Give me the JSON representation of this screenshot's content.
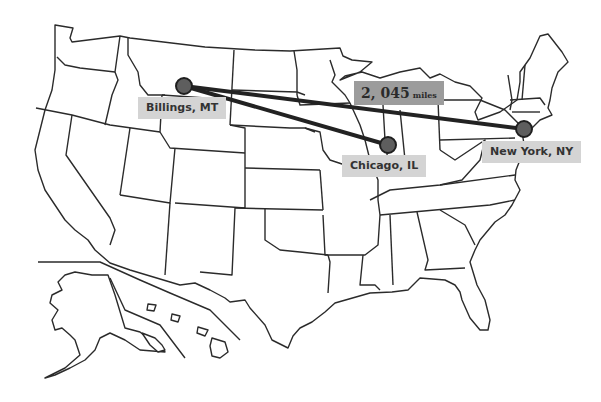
{
  "map": {
    "title": "United States map",
    "style": {
      "background": "#ffffff",
      "stroke": "#2b2b2b",
      "route": "#222222",
      "marker": "#5e5e5e",
      "label_bg": "#d4d4d4",
      "distance_bg": "#9c9c9c"
    }
  },
  "cities": [
    {
      "id": "billings",
      "label": "Billings, MT",
      "x": 184,
      "y": 86
    },
    {
      "id": "chicago",
      "label": "Chicago, IL",
      "x": 388,
      "y": 145
    },
    {
      "id": "newyork",
      "label": "New York, NY",
      "x": 524,
      "y": 129
    }
  ],
  "routes": [
    {
      "from": "Billings, MT",
      "to": "Chicago, IL"
    },
    {
      "from": "Billings, MT",
      "to": "New York, NY"
    }
  ],
  "distance": {
    "value": "2, 045",
    "unit": "miles"
  }
}
